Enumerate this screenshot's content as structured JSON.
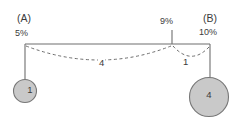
{
  "diagram": {
    "type": "node-link-diagram",
    "stroke_color": "#6e6e6e",
    "node_fill_color": "#c9c9c9",
    "node_stroke_color": "#777777",
    "text_color": "#3b3b3b",
    "group_labels": {
      "left": "(A)",
      "right": "(B)"
    },
    "percent_labels": {
      "left": "5%",
      "middle": "9%",
      "right": "10%"
    },
    "edge_labels": {
      "long_arc": "4",
      "short_arc": "1"
    },
    "nodes": [
      {
        "id": "left-node",
        "label": "1",
        "radius": 12
      },
      {
        "id": "right-node",
        "label": "4",
        "radius": 20
      }
    ]
  }
}
